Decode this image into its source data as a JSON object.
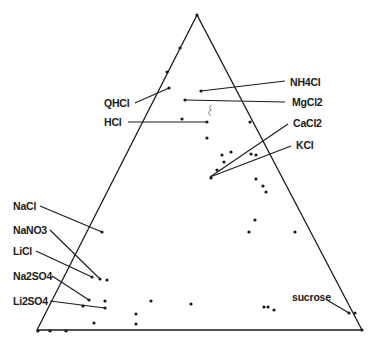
{
  "diagram": {
    "type": "ternary",
    "triangle": {
      "apex": [
        197,
        15
      ],
      "left": [
        37,
        330
      ],
      "right": [
        362,
        330
      ]
    },
    "labels": [
      {
        "id": "nh4cl",
        "text": "NH4Cl",
        "pos": [
          290,
          77
        ],
        "line": [
          [
            201,
            91
          ],
          [
            285,
            81
          ]
        ]
      },
      {
        "id": "qhcl",
        "text": "QHCl",
        "pos": [
          104,
          98
        ],
        "line": [
          [
            135,
            103
          ],
          [
            169,
            88
          ]
        ]
      },
      {
        "id": "mgcl2",
        "text": "MgCl2",
        "pos": [
          292,
          97
        ],
        "line": [
          [
            185,
            100
          ],
          [
            285,
            102
          ]
        ]
      },
      {
        "id": "hcl",
        "text": "HCl",
        "pos": [
          104,
          117
        ],
        "line": [
          [
            128,
            122
          ],
          [
            207,
            122
          ]
        ]
      },
      {
        "id": "cacl2",
        "text": "CaCl2",
        "pos": [
          293,
          118
        ],
        "line": [
          [
            210,
            177
          ],
          [
            288,
            124
          ]
        ]
      },
      {
        "id": "kcl",
        "text": "KCl",
        "pos": [
          296,
          140
        ],
        "line": [
          [
            210,
            177
          ],
          [
            291,
            146
          ]
        ]
      },
      {
        "id": "nacl",
        "text": "NaCl",
        "pos": [
          13,
          201
        ],
        "line": [
          [
            40,
            206
          ],
          [
            102,
            232
          ]
        ]
      },
      {
        "id": "nano3",
        "text": "NaNO3",
        "pos": [
          13,
          225
        ],
        "line": [
          [
            50,
            230
          ],
          [
            100,
            279
          ]
        ]
      },
      {
        "id": "licl",
        "text": "LiCl",
        "pos": [
          13,
          246
        ],
        "line": [
          [
            36,
            251
          ],
          [
            92,
            277
          ]
        ]
      },
      {
        "id": "na2so4",
        "text": "Na2SO4",
        "pos": [
          13,
          271
        ],
        "line": [
          [
            52,
            276
          ],
          [
            89,
            300
          ]
        ]
      },
      {
        "id": "li2so4",
        "text": "Li2SO4",
        "pos": [
          13,
          296
        ],
        "line": [
          [
            50,
            301
          ],
          [
            105,
            308
          ]
        ]
      },
      {
        "id": "sucrose",
        "text": "sucrose",
        "pos": [
          292,
          292
        ],
        "line": [
          [
            327,
            300
          ],
          [
            349,
            313
          ]
        ]
      }
    ],
    "points": [
      [
        197,
        15
      ],
      [
        180,
        48
      ],
      [
        167,
        72
      ],
      [
        169,
        88
      ],
      [
        201,
        91
      ],
      [
        185,
        100
      ],
      [
        182,
        119
      ],
      [
        207,
        122
      ],
      [
        250,
        122
      ],
      [
        207,
        138
      ],
      [
        222,
        155
      ],
      [
        231,
        152
      ],
      [
        224,
        162
      ],
      [
        251,
        154
      ],
      [
        256,
        155
      ],
      [
        217,
        170
      ],
      [
        211,
        178
      ],
      [
        256,
        179
      ],
      [
        263,
        186
      ],
      [
        266,
        192
      ],
      [
        255,
        220
      ],
      [
        249,
        232
      ],
      [
        295,
        232
      ],
      [
        102,
        232
      ],
      [
        92,
        277
      ],
      [
        100,
        279
      ],
      [
        107,
        280
      ],
      [
        89,
        300
      ],
      [
        105,
        301
      ],
      [
        83,
        306
      ],
      [
        105,
        308
      ],
      [
        151,
        301
      ],
      [
        191,
        304
      ],
      [
        136,
        314
      ],
      [
        136,
        324
      ],
      [
        94,
        323
      ],
      [
        264,
        307
      ],
      [
        268,
        307
      ],
      [
        274,
        310
      ],
      [
        349,
        313
      ],
      [
        355,
        313
      ],
      [
        38,
        331
      ],
      [
        50,
        331
      ],
      [
        66,
        331
      ],
      [
        362,
        330
      ]
    ],
    "curl_marks": [
      [
        207,
        107
      ],
      [
        206,
        112
      ]
    ],
    "colors": {
      "ink": "#1a1a1a",
      "background": "#ffffff"
    }
  }
}
